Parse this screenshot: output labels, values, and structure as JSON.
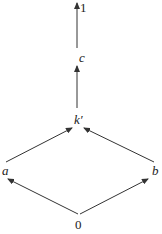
{
  "diagram": {
    "type": "hasse-lattice",
    "nodes": [
      {
        "id": "one",
        "label": "1",
        "italic": false
      },
      {
        "id": "c",
        "label": "c",
        "italic": true
      },
      {
        "id": "kprime",
        "label": "k′",
        "italic": true
      },
      {
        "id": "a",
        "label": "a",
        "italic": true
      },
      {
        "id": "b",
        "label": "b",
        "italic": true
      },
      {
        "id": "zero",
        "label": "0",
        "italic": false
      }
    ],
    "edges": [
      {
        "from": "zero",
        "to": "a"
      },
      {
        "from": "zero",
        "to": "b"
      },
      {
        "from": "a",
        "to": "kprime"
      },
      {
        "from": "b",
        "to": "kprime"
      },
      {
        "from": "kprime",
        "to": "c"
      },
      {
        "from": "c",
        "to": "one"
      }
    ],
    "colors": {
      "stroke": "#333333",
      "text": "#222222",
      "background": "#ffffff"
    }
  }
}
